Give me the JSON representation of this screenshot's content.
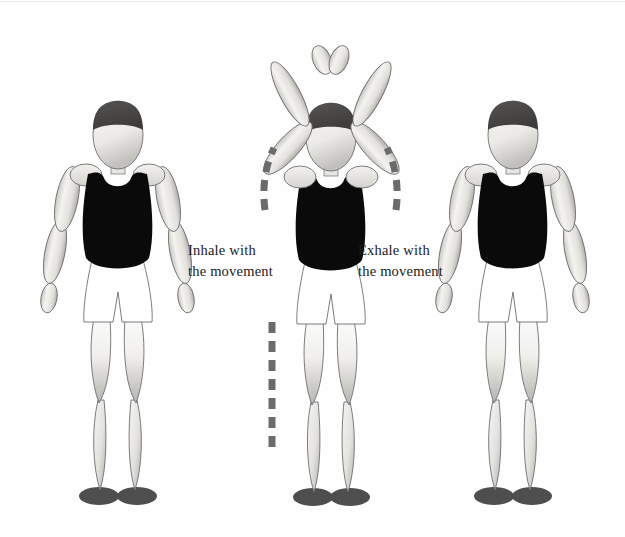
{
  "illustration": {
    "title": "Breathing with arm raise exercise sequence",
    "background_color": "#fefefe"
  },
  "captions": {
    "inhale": "Inhale with\nthe movement",
    "exhale": "Exhale with\nthe movement"
  },
  "palette": {
    "hair": "#4a4a4a",
    "skin_light": "#f2f0ec",
    "skin_shade": "#a8a6a3",
    "tank_top": "#0a0a0a",
    "shorts": "#ffffff",
    "outline": "#6e6e6e",
    "feet": "#4e4e4e",
    "arrow": "#6b6b6b",
    "text": "#1b1b1b"
  },
  "figures": [
    {
      "id": "figure-left",
      "pose": "arms-down",
      "label": "Standing figure with arms at sides"
    },
    {
      "id": "figure-center",
      "pose": "arms-overhead",
      "label": "Standing figure with arms raised overhead, palms together"
    },
    {
      "id": "figure-right",
      "pose": "arms-down",
      "label": "Standing figure with arms at sides"
    }
  ],
  "arrows": [
    {
      "id": "arrow-arc-left",
      "style": "dashed",
      "direction": "upward-arc",
      "side": "left"
    },
    {
      "id": "arrow-arc-right",
      "style": "dashed",
      "direction": "upward-arc",
      "side": "right"
    },
    {
      "id": "arrow-vertical-lower",
      "style": "dashed",
      "direction": "vertical",
      "side": "left-lower"
    }
  ]
}
